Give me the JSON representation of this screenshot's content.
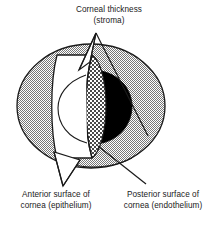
{
  "figure": {
    "name": "cross-section-diagram-of-the-eye-cornea",
    "background_color": "#ffffff",
    "ink_color": "#1a1a1a"
  },
  "labels": {
    "stroma": {
      "line1": "Corneal thickness",
      "line2": "(stroma)"
    },
    "anterior": {
      "line1": "Anterior surface of",
      "line2": "cornea (epithelium)"
    },
    "posterior": {
      "line1": "Posterior surface of",
      "line2": "cornea (endothelium)"
    }
  },
  "regions": {
    "sclera": {
      "name": "sclera-globe",
      "fill": "light-gray-dither",
      "color": "#b9b9b9"
    },
    "anterior_chamber": {
      "name": "anterior-chamber",
      "fill": "white",
      "color": "#ffffff"
    },
    "stroma_band": {
      "name": "corneal-stroma-band",
      "fill": "coarse-checker-dither",
      "color": "#9a9a9a"
    },
    "pupil": {
      "name": "pupil-iris-mass",
      "fill": "solid-black",
      "color": "#000000"
    },
    "lens": {
      "name": "lens-outline",
      "fill": "white",
      "color": "#ffffff"
    }
  },
  "leaders": {
    "stroma_leader": "pointer-from-stroma-label-to-corneal-band",
    "anterior_leader": "pointer-from-anterior-label-to-front-cornea-surface",
    "posterior_leader": "pointer-from-posterior-label-to-back-cornea-surface"
  }
}
